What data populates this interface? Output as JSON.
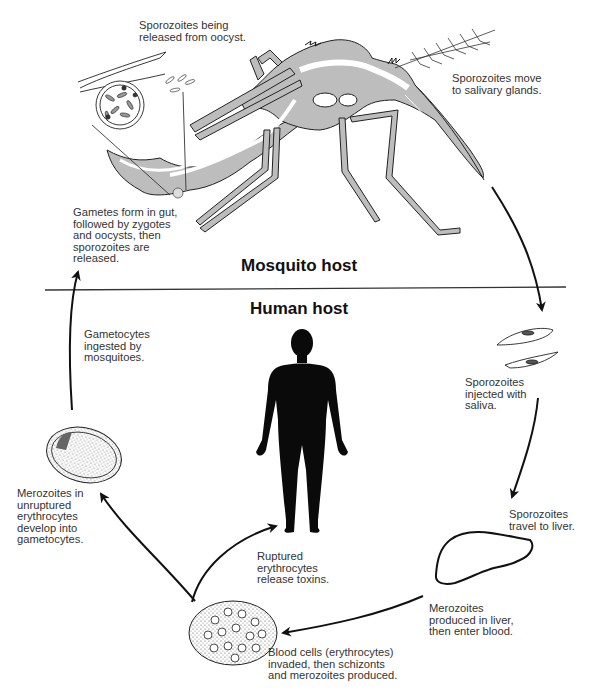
{
  "diagram": {
    "sections": {
      "mosquito": "Mosquito host",
      "human": "Human host"
    },
    "labels": {
      "sporozoites_released": "Sporozoites being\nreleased from oocyst.",
      "salivary_glands": "Sporozoites move\nto salivary glands.",
      "gametes_gut": "Gametes form in gut,\nfollowed by zygotes\nand oocysts, then\nsporozoites are\nreleased.",
      "gametocytes_ingested": "Gametocytes\ningested by\nmosquitoes.",
      "injected_saliva": "Sporozoites\ninjected with\nsaliva.",
      "travel_liver": "Sporozoites\ntravel to liver.",
      "merozoites_liver": "Merozoites\nproduced in liver,\nthen enter blood.",
      "blood_cells_invaded": "Blood cells (erythrocytes)\ninvaded, then schizonts\nand merozoites produced.",
      "ruptured_toxins": "Ruptured\nerythrocytes\nrelease toxins.",
      "merozoites_unruptured": "Merozoites in\nunruptured\nerythrocytes\ndevelop into\ngametocytes."
    },
    "icons": [
      "mosquito-illustration",
      "oocyst-icon",
      "sporozoites-icon",
      "liver-icon",
      "infected-blood-cells-icon",
      "gametocyte-cell-icon",
      "human-silhouette-icon"
    ],
    "colors": {
      "ink": "#111111",
      "fill_gray": "#bdbdbd",
      "background": "#ffffff"
    }
  }
}
